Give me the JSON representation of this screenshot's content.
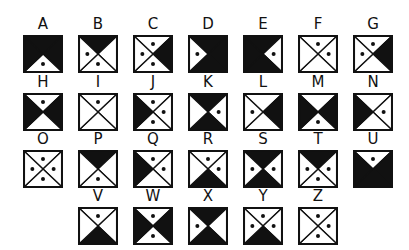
{
  "colors": {
    "ink": "#111111",
    "paper": "#ffffff"
  },
  "layout": {
    "col_x": [
      23,
      78,
      133,
      188,
      243,
      298,
      353
    ],
    "row_y": [
      35,
      93,
      150,
      207
    ]
  },
  "letters": [
    {
      "letter": "A",
      "row": 0,
      "col": 0,
      "fill": {
        "top": 1,
        "right": 1,
        "bottom": 0,
        "left": 1
      },
      "dots": [
        "bottom"
      ]
    },
    {
      "letter": "B",
      "row": 0,
      "col": 1,
      "fill": {
        "top": 1,
        "right": 0,
        "bottom": 0,
        "left": 0
      },
      "dots": [
        "left",
        "bottom"
      ]
    },
    {
      "letter": "C",
      "row": 0,
      "col": 2,
      "fill": {
        "top": 0,
        "right": 1,
        "bottom": 0,
        "left": 0
      },
      "dots": [
        "top",
        "left",
        "bottom"
      ]
    },
    {
      "letter": "D",
      "row": 0,
      "col": 3,
      "fill": {
        "top": 1,
        "right": 1,
        "bottom": 1,
        "left": 0
      },
      "dots": [
        "left"
      ]
    },
    {
      "letter": "E",
      "row": 0,
      "col": 4,
      "fill": {
        "top": 1,
        "right": 0,
        "bottom": 1,
        "left": 1
      },
      "dots": [
        "right"
      ]
    },
    {
      "letter": "F",
      "row": 0,
      "col": 5,
      "fill": {
        "top": 0,
        "right": 0,
        "bottom": 0,
        "left": 0
      },
      "dots": [
        "top",
        "right"
      ]
    },
    {
      "letter": "G",
      "row": 0,
      "col": 6,
      "fill": {
        "top": 0,
        "right": 1,
        "bottom": 0,
        "left": 0
      },
      "dots": [
        "top",
        "left"
      ]
    },
    {
      "letter": "H",
      "row": 1,
      "col": 0,
      "fill": {
        "top": 0,
        "right": 1,
        "bottom": 0,
        "left": 1
      },
      "dots": [
        "top"
      ]
    },
    {
      "letter": "I",
      "row": 1,
      "col": 1,
      "fill": {
        "top": 0,
        "right": 0,
        "bottom": 0,
        "left": 0
      },
      "dots": [
        "top"
      ]
    },
    {
      "letter": "J",
      "row": 1,
      "col": 2,
      "fill": {
        "top": 0,
        "right": 0,
        "bottom": 0,
        "left": 1
      },
      "dots": [
        "top",
        "right",
        "bottom"
      ]
    },
    {
      "letter": "K",
      "row": 1,
      "col": 3,
      "fill": {
        "top": 1,
        "right": 0,
        "bottom": 1,
        "left": 0
      },
      "dots": [
        "right"
      ]
    },
    {
      "letter": "L",
      "row": 1,
      "col": 4,
      "fill": {
        "top": 0,
        "right": 1,
        "bottom": 0,
        "left": 0
      },
      "dots": [
        "left"
      ]
    },
    {
      "letter": "M",
      "row": 1,
      "col": 5,
      "fill": {
        "top": 0,
        "right": 1,
        "bottom": 0,
        "left": 1
      },
      "dots": [
        "bottom"
      ]
    },
    {
      "letter": "N",
      "row": 1,
      "col": 6,
      "fill": {
        "top": 0,
        "right": 0,
        "bottom": 0,
        "left": 1
      },
      "dots": [
        "right"
      ]
    },
    {
      "letter": "O",
      "row": 2,
      "col": 0,
      "fill": {
        "top": 0,
        "right": 0,
        "bottom": 0,
        "left": 0
      },
      "dots": [
        "top",
        "right",
        "bottom",
        "left"
      ]
    },
    {
      "letter": "P",
      "row": 2,
      "col": 1,
      "fill": {
        "top": 1,
        "right": 0,
        "bottom": 0,
        "left": 0
      },
      "dots": [
        "bottom"
      ]
    },
    {
      "letter": "Q",
      "row": 2,
      "col": 2,
      "fill": {
        "top": 0,
        "right": 0,
        "bottom": 0,
        "left": 1
      },
      "dots": [
        "top",
        "right"
      ]
    },
    {
      "letter": "R",
      "row": 2,
      "col": 3,
      "fill": {
        "top": 0,
        "right": 0,
        "bottom": 1,
        "left": 0
      },
      "dots": [
        "top",
        "right"
      ]
    },
    {
      "letter": "S",
      "row": 2,
      "col": 4,
      "fill": {
        "top": 1,
        "right": 0,
        "bottom": 1,
        "left": 0
      },
      "dots": [
        "left",
        "right"
      ]
    },
    {
      "letter": "T",
      "row": 2,
      "col": 5,
      "fill": {
        "top": 1,
        "right": 0,
        "bottom": 0,
        "left": 0
      },
      "dots": [
        "left",
        "right",
        "bottom"
      ]
    },
    {
      "letter": "U",
      "row": 2,
      "col": 6,
      "fill": {
        "top": 0,
        "right": 1,
        "bottom": 1,
        "left": 1
      },
      "dots": [
        "top"
      ]
    },
    {
      "letter": "V",
      "row": 3,
      "col": 1,
      "fill": {
        "top": 0,
        "right": 0,
        "bottom": 1,
        "left": 0
      },
      "dots": [
        "top"
      ]
    },
    {
      "letter": "W",
      "row": 3,
      "col": 2,
      "fill": {
        "top": 0,
        "right": 1,
        "bottom": 0,
        "left": 1
      },
      "dots": [
        "top",
        "bottom"
      ]
    },
    {
      "letter": "X",
      "row": 3,
      "col": 3,
      "fill": {
        "top": 1,
        "right": 0,
        "bottom": 1,
        "left": 0
      },
      "dots": [
        "left"
      ]
    },
    {
      "letter": "Y",
      "row": 3,
      "col": 4,
      "fill": {
        "top": 0,
        "right": 0,
        "bottom": 1,
        "left": 0
      },
      "dots": [
        "top",
        "left",
        "right"
      ]
    },
    {
      "letter": "Z",
      "row": 3,
      "col": 5,
      "fill": {
        "top": 0,
        "right": 0,
        "bottom": 0,
        "left": 0
      },
      "dots": [
        "top",
        "right",
        "bottom"
      ]
    }
  ]
}
